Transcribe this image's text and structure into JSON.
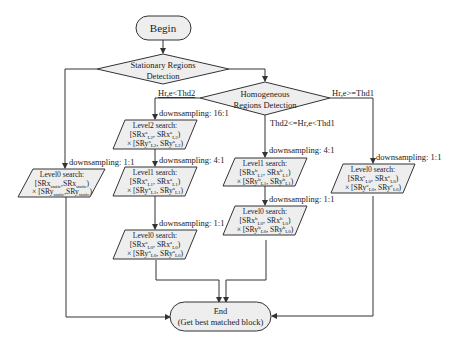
{
  "begin": {
    "label": "Begin"
  },
  "decision_stationary": {
    "line1": "Stationary Regions",
    "line2": "Detection"
  },
  "decision_homogeneous": {
    "line1": "Homogeneous",
    "line2": "Regions Detection"
  },
  "conditions": {
    "low": "Hr,e<Thd2",
    "mid": "Thd2<=Hr,e<Thd1",
    "high": "Hr,e>=Thd1"
  },
  "edges": {
    "stationary_ds": "downsampling: 1:1",
    "a_ds_level2": "downsampling: 16:1",
    "a_ds_level1": "downsampling: 4:1",
    "a_ds_level0": "downsampling: 1:1",
    "b_ds_level1": "downsampling: 4:1",
    "b_ds_level0": "downsampling: 1:1",
    "c_ds_level0": "downsampling: 1:1"
  },
  "boxes": {
    "static_l0": {
      "title": "Level0 search:",
      "x_range": {
        "prefix": "[SRx",
        "sub1": "static",
        "mid": ",SRx",
        "sub2": "static",
        "suffix": ")"
      },
      "y_range": {
        "prefix": "× [SRy",
        "sub1": "static",
        "mid": ",SRy",
        "sub2": "static",
        "suffix": ")"
      }
    },
    "a_l2": {
      "title": "Level2 search:",
      "line1": "[SRx",
      "sup": "a",
      "level": "L2",
      "line2": "× [SRy"
    },
    "a_l1": {
      "title": "Level1 search:",
      "line1": "[SRx",
      "sup": "a",
      "level": "L1",
      "line2": "× [SRy"
    },
    "a_l0": {
      "title": "Level0 search:",
      "line1": "[SRx",
      "sup": "a",
      "level": "L0",
      "line2": "× [SRy"
    },
    "b_l1": {
      "title": "Level1 search:",
      "line1": "[SRx",
      "sup": "b",
      "level": "L1",
      "line2": "× [SRy"
    },
    "b_l0": {
      "title": "Level0 search:",
      "line1": "[SRx",
      "sup": "b",
      "level": "L0",
      "line2": "× [SRy"
    },
    "c_l0": {
      "title": "Level0 search:",
      "line1": "[SRx",
      "sup": "c",
      "level": "L0",
      "line2": "× [SRy"
    }
  },
  "end": {
    "line1": "End",
    "line2": "(Get best matched block)"
  }
}
